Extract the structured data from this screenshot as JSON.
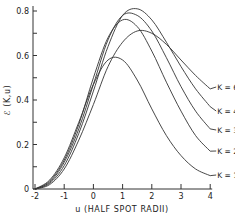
{
  "chart_data": {
    "type": "line",
    "title": "",
    "xlabel": "u (HALF SPOT RADII)",
    "ylabel": "ℰ (K,u)",
    "xlim": [
      -2,
      4
    ],
    "ylim": [
      0,
      0.85
    ],
    "x_ticks": [
      "-2",
      "-1",
      "0",
      "1",
      "2",
      "3",
      "4"
    ],
    "y_ticks": [
      "0",
      "0.2",
      "0.4",
      "0.6",
      "0.8"
    ],
    "grid": false,
    "legend": "inline labels at right end of curves",
    "x": [
      -2,
      -1.5,
      -1,
      -0.5,
      0,
      0.5,
      1,
      1.5,
      2,
      2.5,
      3,
      3.5,
      4
    ],
    "series": [
      {
        "name": "K=1",
        "label": "K = 1",
        "values": [
          0.0,
          0.04,
          0.14,
          0.3,
          0.47,
          0.58,
          0.58,
          0.49,
          0.36,
          0.24,
          0.15,
          0.09,
          0.06
        ]
      },
      {
        "name": "K=2",
        "label": "K = 2",
        "values": [
          0.0,
          0.035,
          0.13,
          0.29,
          0.5,
          0.68,
          0.76,
          0.73,
          0.62,
          0.48,
          0.35,
          0.24,
          0.17
        ]
      },
      {
        "name": "K=3",
        "label": "K = 3",
        "values": [
          0.0,
          0.03,
          0.12,
          0.27,
          0.47,
          0.67,
          0.78,
          0.78,
          0.71,
          0.59,
          0.46,
          0.35,
          0.27
        ]
      },
      {
        "name": "K=4",
        "label": "K = 4",
        "values": [
          0.0,
          0.025,
          0.105,
          0.25,
          0.44,
          0.64,
          0.78,
          0.81,
          0.76,
          0.66,
          0.55,
          0.45,
          0.37
        ]
      },
      {
        "name": "K=6",
        "label": "K = 6",
        "values": [
          0.0,
          0.02,
          0.09,
          0.22,
          0.38,
          0.55,
          0.66,
          0.71,
          0.7,
          0.65,
          0.58,
          0.51,
          0.45
        ]
      }
    ]
  }
}
